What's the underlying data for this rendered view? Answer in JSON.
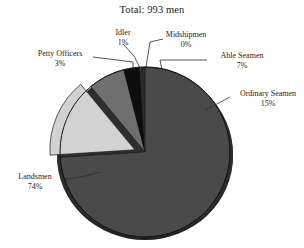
{
  "chart_data": {
    "type": "pie",
    "title": "Total: 993 men",
    "xlabel": "",
    "ylabel": "",
    "legend_position": "none",
    "grid": false,
    "total_label": "Total: 993 men",
    "total_value": 993,
    "units": "men",
    "categories": [
      "Landsmen",
      "Ordinary Seamen",
      "Able Seamen",
      "Petty Officers",
      "Idler",
      "Midshipmen"
    ],
    "values": [
      74,
      15,
      7,
      3,
      1,
      0
    ],
    "value_labels": [
      "74%",
      "15%",
      "7%",
      "3%",
      "1%",
      "0%"
    ],
    "colors": [
      "#4a4a4a",
      "#d2d2d2",
      "#6f6f6f",
      "#0d0d0d",
      "#2a2a2a",
      "#f2f2f2"
    ],
    "slices": [
      {
        "name": "Landsmen",
        "pct": 74,
        "pct_label": "74%",
        "color": "#4a4a4a",
        "exploded": false
      },
      {
        "name": "Ordinary Seamen",
        "pct": 15,
        "pct_label": "15%",
        "color": "#d2d2d2",
        "exploded": true
      },
      {
        "name": "Able Seamen",
        "pct": 7,
        "pct_label": "7%",
        "color": "#6f6f6f",
        "exploded": false
      },
      {
        "name": "Petty Officers",
        "pct": 3,
        "pct_label": "3%",
        "color": "#0d0d0d",
        "exploded": false
      },
      {
        "name": "Idler",
        "pct": 1,
        "pct_label": "1%",
        "color": "#2a2a2a",
        "exploded": false
      },
      {
        "name": "Midshipmen",
        "pct": 0,
        "pct_label": "0%",
        "color": "#f2f2f2",
        "exploded": false
      }
    ]
  },
  "labels": {
    "idler": {
      "name": "Idler",
      "pct": "1%"
    },
    "midshipmen": {
      "name": "Midshipmen",
      "pct": "0%"
    },
    "petty_officers": {
      "name": "Petty Officers",
      "pct": "3%"
    },
    "able_seamen": {
      "name": "Able Seamen",
      "pct": "7%"
    },
    "ordinary_seamen": {
      "name": "Ordinary Seamen",
      "pct": "15%"
    },
    "landsmen": {
      "name": "Landsmen",
      "pct": "74%"
    }
  },
  "style": {
    "background": "#ffffff",
    "text_color": "#1c1c1c",
    "leader_line_color": "#2b2b2b",
    "pie_edge_color": "#1a1a1a"
  }
}
